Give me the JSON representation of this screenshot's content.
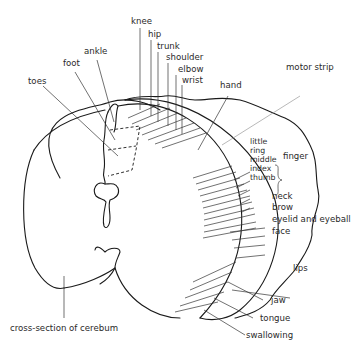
{
  "diagram": {
    "labels": {
      "knee": "knee",
      "hip": "hip",
      "trunk": "trunk",
      "shoulder": "shoulder",
      "elbow": "elbow",
      "wrist": "wrist",
      "ankle": "ankle",
      "foot": "foot",
      "toes": "toes",
      "hand": "hand",
      "motor_strip": "motor strip",
      "little": "little",
      "ring": "ring",
      "middle": "middle",
      "index": "index",
      "thumb": "thumb",
      "finger": "finger",
      "neck": "neck",
      "brow": "brow",
      "eyelid": "eyelid and eyeball",
      "face": "face",
      "lips": "lips",
      "jaw": "jaw",
      "tongue": "tongue",
      "swallowing": "swallowing",
      "cerebrum": "cross-section of cerebum"
    },
    "colors": {
      "line": "#1a1a1a",
      "leader": "#333333",
      "motor_strip_leader": "#9a9a9a",
      "text": "#2a2a2a",
      "background": "#ffffff"
    }
  }
}
